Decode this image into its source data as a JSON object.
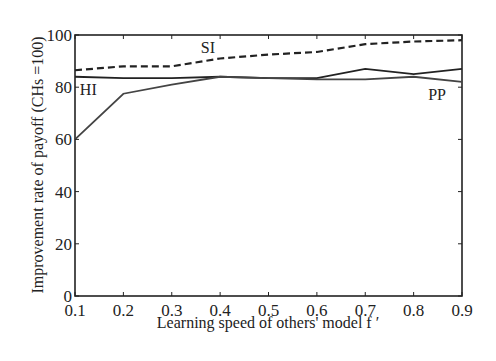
{
  "chart_data": {
    "type": "line",
    "title": "",
    "xlabel": "Learning speed of others' model f ′",
    "ylabel": "Improvement rate of payoff (CHs =100)",
    "x": [
      0.1,
      0.2,
      0.3,
      0.4,
      0.5,
      0.6,
      0.7,
      0.8,
      0.9
    ],
    "xlim": [
      0.1,
      0.9
    ],
    "ylim": [
      0,
      100
    ],
    "xticks": [
      "0.1",
      "0.2",
      "0.3",
      "0.4",
      "0.5",
      "0.6",
      "0.7",
      "0.8",
      "0.9"
    ],
    "yticks": [
      "0",
      "20",
      "40",
      "60",
      "80",
      "100"
    ],
    "grid": false,
    "legend": "inline labels",
    "series": [
      {
        "name": "SI",
        "style": "dashed",
        "values": [
          86.5,
          88,
          88,
          91,
          92.5,
          93.5,
          96.5,
          97.5,
          98
        ]
      },
      {
        "name": "HI",
        "style": "solid",
        "values": [
          84,
          83.5,
          83.5,
          84,
          83.5,
          83.5,
          87,
          85,
          87
        ]
      },
      {
        "name": "PP",
        "style": "solid",
        "values": [
          60,
          77.5,
          81,
          84,
          83.5,
          83,
          83,
          84,
          82
        ]
      }
    ],
    "annotations": [
      {
        "text": "SI",
        "x": 0.36,
        "y": 93
      },
      {
        "text": "HI",
        "x": 0.11,
        "y": 77
      },
      {
        "text": "PP",
        "x": 0.83,
        "y": 75
      }
    ]
  }
}
